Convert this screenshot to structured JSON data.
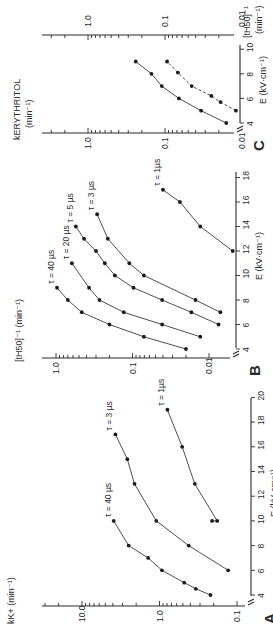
{
  "figure": {
    "orientation": "rotated-90-ccw",
    "panels": [
      {
        "id": "A",
        "panel_label": "A",
        "ylabel": "k",
        "ylabel_sub": "K",
        "ylabel_sup": "+",
        "ylabel_unit": "(min⁻¹)",
        "xlabel": "E (kV·cm⁻¹)",
        "y_tick_labels": [
          "0.1",
          "1.0",
          "10.0"
        ],
        "x_tick_labels": [
          "4",
          "6",
          "8",
          "10",
          "12",
          "14",
          "16",
          "18",
          "20"
        ]
      },
      {
        "id": "B",
        "panel_label": "B",
        "ylabel": "[t",
        "ylabel_sub": "H50",
        "ylabel_sup": "]⁻¹",
        "ylabel_unit": "(min⁻¹)",
        "xlabel": "E (kV·cm⁻¹)",
        "y_tick_labels": [
          "0.01",
          "0.1",
          "1.0"
        ],
        "x_tick_labels": [
          "4",
          "6",
          "8",
          "10",
          "12",
          "14",
          "16",
          "18"
        ]
      },
      {
        "id": "C",
        "panel_label": "C",
        "ylabel_left": "k",
        "ylabel_left_sub": "ERYTHRITOL",
        "ylabel_left_unit": "(min⁻¹)",
        "ylabel_right": "[t",
        "ylabel_right_sub": "H50",
        "ylabel_right_sup": "]⁻¹",
        "ylabel_right_unit": "(min⁻¹)",
        "xlabel": "E (kV·cm⁻¹)",
        "y_tick_labels": [
          "0.01",
          "0.1",
          "1.0"
        ],
        "x_tick_labels": [
          "4",
          "6",
          "8",
          "10"
        ]
      }
    ]
  },
  "chart_data": [
    {
      "panel": "A",
      "type": "line",
      "title": "",
      "xlabel": "E (kV·cm⁻¹)",
      "ylabel": "k_K+ (min⁻¹)",
      "yscale": "log",
      "xlim": [
        3,
        20
      ],
      "ylim": [
        0.1,
        30
      ],
      "grid": false,
      "series": [
        {
          "name": "τ = 40 µs",
          "style": "solid",
          "x": [
            4,
            4.5,
            5,
            6,
            7,
            8,
            10
          ],
          "y": [
            0.22,
            0.34,
            0.48,
            0.93,
            1.4,
            2.5,
            3.9
          ]
        },
        {
          "name": "τ = 3 µs",
          "style": "solid",
          "x": [
            6,
            8,
            10,
            13,
            15,
            17
          ],
          "y": [
            0.13,
            0.42,
            1.1,
            2.1,
            2.6,
            3.7
          ]
        },
        {
          "name": "τ = 1µs",
          "style": "solid",
          "x": [
            10,
            10,
            13,
            16,
            19
          ],
          "y": [
            0.21,
            0.18,
            0.35,
            0.51,
            0.79
          ]
        }
      ]
    },
    {
      "panel": "B",
      "type": "line",
      "title": "",
      "xlabel": "E (kV·cm⁻¹)",
      "ylabel": "[t_H50]⁻¹ (min⁻¹)",
      "yscale": "log",
      "xlim": [
        3,
        19
      ],
      "ylim": [
        0.004,
        1.5
      ],
      "grid": false,
      "series": [
        {
          "name": "τ = 40 µs",
          "style": "solid",
          "x": [
            4,
            5,
            6,
            7,
            8,
            9
          ],
          "y": [
            0.02,
            0.071,
            0.2,
            0.46,
            0.7,
            0.97
          ]
        },
        {
          "name": "τ = 20 µs",
          "style": "solid",
          "x": [
            5,
            6,
            7,
            8,
            9,
            11
          ],
          "y": [
            0.013,
            0.041,
            0.13,
            0.27,
            0.37,
            0.62
          ]
        },
        {
          "name": "τ = 5 µs",
          "style": "solid",
          "x": [
            6,
            7,
            8,
            9,
            10,
            11,
            12,
            13,
            14
          ],
          "y": [
            0.0075,
            0.017,
            0.041,
            0.097,
            0.17,
            0.23,
            0.3,
            0.43,
            0.55
          ]
        },
        {
          "name": "τ = 3 µs",
          "style": "solid",
          "x": [
            7,
            8,
            10,
            11,
            13,
            15
          ],
          "y": [
            0.0071,
            0.015,
            0.071,
            0.11,
            0.21,
            0.29
          ]
        },
        {
          "name": "τ = 1µs",
          "style": "solid",
          "x": [
            12,
            14,
            16,
            17
          ],
          "y": [
            0.0049,
            0.013,
            0.024,
            0.04
          ]
        }
      ]
    },
    {
      "panel": "C",
      "type": "line",
      "title": "",
      "xlabel": "E (kV·cm⁻¹)",
      "ylabel": "k_ERYTHRITOL (min⁻¹)",
      "ylabel_right": "[t_H50]⁻¹ (min⁻¹)",
      "yscale": "log",
      "xlim": [
        3,
        10
      ],
      "ylim": [
        0.01,
        1.5
      ],
      "grid": false,
      "series": [
        {
          "name": "k_ERYTHRITOL",
          "style": "solid",
          "axis": "left",
          "x": [
            4,
            5,
            6,
            7,
            8,
            9
          ],
          "y": [
            0.016,
            0.034,
            0.066,
            0.11,
            0.15,
            0.24
          ]
        },
        {
          "name": "[t_H50]⁻¹",
          "style": "dashed",
          "axis": "right",
          "x": [
            5,
            5.7,
            6.2,
            7,
            8.1,
            9
          ],
          "y": [
            0.012,
            0.019,
            0.025,
            0.045,
            0.068,
            0.094
          ]
        }
      ]
    }
  ]
}
